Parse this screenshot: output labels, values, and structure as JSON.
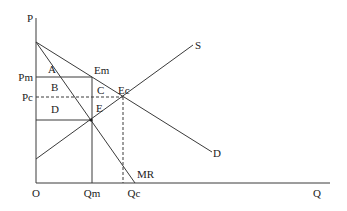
{
  "diagram": {
    "type": "monopoly-vs-competition-welfare",
    "axes": {
      "y_label": "P",
      "x_label": "Q",
      "origin_label": "O"
    },
    "price_labels": {
      "monopoly": "Pm",
      "competitive": "Pc"
    },
    "quantity_labels": {
      "monopoly": "Qm",
      "competitive": "Qc"
    },
    "curves": {
      "supply": "S",
      "demand": "D",
      "marginal_revenue": "MR"
    },
    "points": {
      "monopoly_equilibrium": "Em",
      "competitive_equilibrium": "Ec",
      "mr_mc_intersection": "E"
    },
    "areas": [
      "A",
      "B",
      "C",
      "D",
      "E"
    ],
    "colors": {
      "line": "#3a3a3a",
      "text": "#222222",
      "background": "#ffffff"
    }
  }
}
